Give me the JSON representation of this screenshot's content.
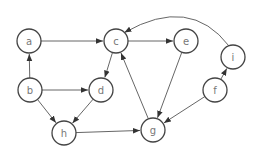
{
  "diagram": {
    "type": "directed-graph",
    "node_radius": 12,
    "nodes": [
      {
        "id": "a",
        "label": "a",
        "x": 29,
        "y": 41
      },
      {
        "id": "c",
        "label": "c",
        "x": 116,
        "y": 41
      },
      {
        "id": "e",
        "label": "e",
        "x": 186,
        "y": 41
      },
      {
        "id": "i",
        "label": "i",
        "x": 233,
        "y": 57
      },
      {
        "id": "b",
        "label": "b",
        "x": 30,
        "y": 90
      },
      {
        "id": "d",
        "label": "d",
        "x": 101,
        "y": 90
      },
      {
        "id": "f",
        "label": "f",
        "x": 215,
        "y": 90
      },
      {
        "id": "h",
        "label": "h",
        "x": 64,
        "y": 133
      },
      {
        "id": "g",
        "label": "g",
        "x": 153,
        "y": 130
      }
    ],
    "edges": [
      {
        "from": "a",
        "to": "c"
      },
      {
        "from": "b",
        "to": "a"
      },
      {
        "from": "b",
        "to": "d"
      },
      {
        "from": "b",
        "to": "h"
      },
      {
        "from": "c",
        "to": "e"
      },
      {
        "from": "c",
        "to": "d"
      },
      {
        "from": "d",
        "to": "h"
      },
      {
        "from": "h",
        "to": "g"
      },
      {
        "from": "g",
        "to": "c"
      },
      {
        "from": "e",
        "to": "g"
      },
      {
        "from": "f",
        "to": "g"
      },
      {
        "from": "f",
        "to": "i"
      },
      {
        "from": "i",
        "to": "c",
        "curved": true
      }
    ],
    "colors": {
      "node_stroke": "#444444",
      "label": "#777777",
      "edge": "#555555"
    }
  }
}
